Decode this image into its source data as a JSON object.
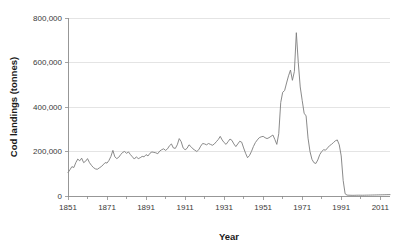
{
  "chart_data": {
    "type": "line",
    "title": "",
    "xlabel": "Year",
    "ylabel": "Cod landings (tonnes)",
    "xlim": [
      1851,
      2016
    ],
    "ylim": [
      0,
      800000
    ],
    "grid": "horizontal",
    "legend": "none",
    "line_color": "#7d7d7d",
    "background_color": "#ffffff",
    "x_tick_labels": [
      "1851",
      "1871",
      "1891",
      "1911",
      "1931",
      "1951",
      "1971",
      "1991",
      "2011"
    ],
    "x_tick_values": [
      1851,
      1871,
      1891,
      1911,
      1931,
      1951,
      1971,
      1991,
      2011
    ],
    "x_minor_tick_values": [
      1861,
      1881,
      1901,
      1921,
      1941,
      1961,
      1981,
      2001,
      2011
    ],
    "y_tick_labels": [
      "0",
      "200,000",
      "400,000",
      "600,000",
      "800,000"
    ],
    "y_tick_values": [
      0,
      200000,
      400000,
      600000,
      800000
    ],
    "series": [
      {
        "name": "Cod landings",
        "x": [
          1851,
          1852,
          1853,
          1854,
          1855,
          1856,
          1857,
          1858,
          1859,
          1860,
          1861,
          1862,
          1863,
          1864,
          1865,
          1866,
          1867,
          1868,
          1869,
          1870,
          1871,
          1872,
          1873,
          1874,
          1875,
          1876,
          1877,
          1878,
          1879,
          1880,
          1881,
          1882,
          1883,
          1884,
          1885,
          1886,
          1887,
          1888,
          1889,
          1890,
          1891,
          1892,
          1893,
          1894,
          1895,
          1896,
          1897,
          1898,
          1899,
          1900,
          1901,
          1902,
          1903,
          1904,
          1905,
          1906,
          1907,
          1908,
          1909,
          1910,
          1911,
          1912,
          1913,
          1914,
          1915,
          1916,
          1917,
          1918,
          1919,
          1920,
          1921,
          1922,
          1923,
          1924,
          1925,
          1926,
          1927,
          1928,
          1929,
          1930,
          1931,
          1932,
          1933,
          1934,
          1935,
          1936,
          1937,
          1938,
          1939,
          1940,
          1941,
          1942,
          1943,
          1944,
          1945,
          1946,
          1947,
          1948,
          1949,
          1950,
          1951,
          1952,
          1953,
          1954,
          1955,
          1956,
          1957,
          1958,
          1959,
          1960,
          1961,
          1962,
          1963,
          1964,
          1965,
          1966,
          1967,
          1968,
          1969,
          1970,
          1971,
          1972,
          1973,
          1974,
          1975,
          1976,
          1977,
          1978,
          1979,
          1980,
          1981,
          1982,
          1983,
          1984,
          1985,
          1986,
          1987,
          1988,
          1989,
          1990,
          1991,
          1992,
          1993,
          1994,
          1995,
          1996,
          1997,
          1998,
          1999,
          2000,
          2001,
          2002,
          2003,
          2004,
          2005,
          2006,
          2007,
          2008,
          2009,
          2010,
          2011,
          2012,
          2013,
          2014,
          2015,
          2016
        ],
        "values": [
          105000,
          118000,
          132000,
          128000,
          150000,
          166000,
          158000,
          170000,
          150000,
          156000,
          168000,
          150000,
          138000,
          128000,
          122000,
          120000,
          126000,
          132000,
          140000,
          150000,
          148000,
          160000,
          178000,
          205000,
          176000,
          168000,
          174000,
          186000,
          196000,
          200000,
          192000,
          198000,
          186000,
          176000,
          166000,
          176000,
          168000,
          172000,
          178000,
          176000,
          186000,
          180000,
          192000,
          198000,
          196000,
          194000,
          190000,
          202000,
          208000,
          212000,
          205000,
          212000,
          226000,
          234000,
          216000,
          214000,
          230000,
          258000,
          244000,
          216000,
          208000,
          214000,
          230000,
          222000,
          212000,
          206000,
          200000,
          208000,
          224000,
          236000,
          234000,
          230000,
          236000,
          232000,
          228000,
          234000,
          244000,
          254000,
          268000,
          252000,
          240000,
          232000,
          244000,
          256000,
          250000,
          234000,
          222000,
          234000,
          246000,
          242000,
          216000,
          192000,
          172000,
          182000,
          200000,
          222000,
          240000,
          252000,
          262000,
          266000,
          268000,
          262000,
          258000,
          262000,
          268000,
          274000,
          254000,
          232000,
          280000,
          420000,
          466000,
          474000,
          508000,
          540000,
          566000,
          520000,
          560000,
          734000,
          600000,
          490000,
          430000,
          372000,
          360000,
          260000,
          200000,
          165000,
          150000,
          146000,
          162000,
          186000,
          200000,
          208000,
          206000,
          216000,
          226000,
          232000,
          240000,
          248000,
          252000,
          230000,
          180000,
          70000,
          10000,
          4000,
          3500,
          3200,
          3000,
          3200,
          3500,
          3600,
          3500,
          3400,
          3600,
          3800,
          4000,
          4200,
          4400,
          4600,
          4800,
          5000,
          5200,
          5400,
          5600,
          5800,
          6000,
          6200
        ]
      }
    ],
    "annotations": []
  }
}
